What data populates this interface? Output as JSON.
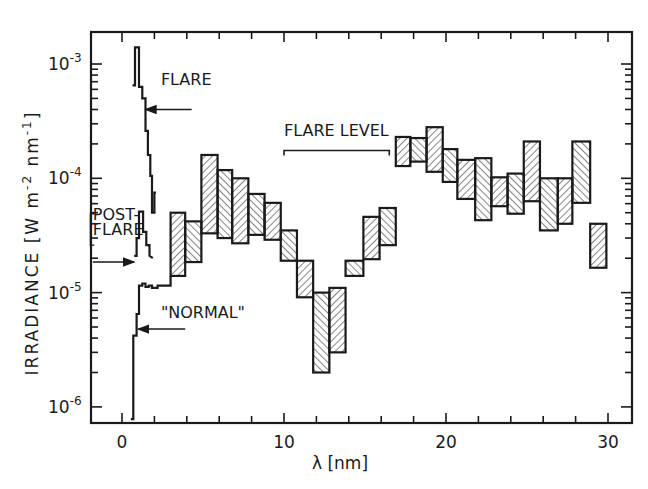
{
  "chart_data": {
    "type": "bar",
    "subtype": "floating-range-histogram-with-step-lines",
    "title": "",
    "xlabel": "λ [nm]",
    "ylabel": "IRRADIANCE [W m^-2 nm^-1]",
    "ylabel_parts": {
      "main": "IRRADIANCE [W m",
      "exp1": "-2",
      "mid": " nm",
      "exp2": "-1",
      "end": "]"
    },
    "yscale": "log",
    "xlim": [
      -2.1,
      31.5
    ],
    "ylim": [
      7e-07,
      0.002
    ],
    "grid": false,
    "x_ticks": [
      0,
      10,
      20,
      30
    ],
    "x_minor_step": 2,
    "y_ticks": [
      {
        "value": 0.001,
        "base": "10",
        "exp": "-3"
      },
      {
        "value": 0.0001,
        "base": "10",
        "exp": "-4"
      },
      {
        "value": 1e-05,
        "base": "10",
        "exp": "-5"
      },
      {
        "value": 1e-06,
        "base": "10",
        "exp": "-6"
      }
    ],
    "bars": {
      "name": "Irradiance range (hatched)",
      "bin_edges": [
        3.0,
        3.9,
        4.9,
        5.9,
        6.8,
        7.8,
        8.8,
        9.8,
        10.8,
        11.8,
        12.8,
        13.8,
        14.9,
        15.9,
        16.9,
        17.8,
        18.8,
        19.8,
        20.7,
        21.8,
        22.8,
        23.8,
        24.8,
        25.8,
        26.9,
        27.8,
        28.9,
        29.9
      ],
      "high": [
        5e-05,
        4.2e-05,
        0.00016,
        0.000118,
        0.0001,
        7.3e-05,
        6.1e-05,
        3.5e-05,
        1.9e-05,
        1e-05,
        1.1e-05,
        1.9e-05,
        4.6e-05,
        5.5e-05,
        0.00023,
        0.000225,
        0.00028,
        0.00018,
        0.000145,
        0.00015,
        0.000102,
        0.00011,
        0.00021,
        0.0001,
        0.0001,
        0.00021,
        4e-05
      ],
      "low": [
        1.4e-05,
        1.85e-05,
        3.3e-05,
        3e-05,
        2.7e-05,
        3.2e-05,
        2.9e-05,
        1.9e-05,
        9.1e-06,
        2e-06,
        3e-06,
        1.4e-05,
        1.96e-05,
        2.6e-05,
        0.000128,
        0.00014,
        0.000114,
        9.3e-05,
        6.6e-05,
        4.3e-05,
        5.7e-05,
        4.9e-05,
        6.3e-05,
        3.5e-05,
        4e-05,
        6.1e-05,
        1.65e-05
      ]
    },
    "series": [
      {
        "name": "FLARE",
        "points": [
          [
            0.65,
            0.00065
          ],
          [
            0.8,
            0.00065
          ],
          [
            0.8,
            0.0014
          ],
          [
            1.05,
            0.0014
          ],
          [
            1.05,
            0.00063
          ],
          [
            1.25,
            0.00063
          ],
          [
            1.25,
            0.0005
          ],
          [
            1.45,
            0.0005
          ],
          [
            1.45,
            0.00026
          ],
          [
            1.6,
            0.00026
          ],
          [
            1.6,
            0.00016
          ],
          [
            1.75,
            0.00016
          ],
          [
            1.75,
            0.000105
          ],
          [
            1.85,
            0.000105
          ],
          [
            1.85,
            5e-05
          ],
          [
            2.0,
            5e-05
          ],
          [
            2.0,
            7.5e-05
          ],
          [
            2.1,
            7.5e-05
          ]
        ]
      },
      {
        "name": "POST-FLARE",
        "points": [
          [
            0.75,
            2.1e-05
          ],
          [
            0.9,
            2.1e-05
          ],
          [
            0.9,
            3e-05
          ],
          [
            1.05,
            3e-05
          ],
          [
            1.05,
            5.1e-05
          ],
          [
            1.3,
            5.1e-05
          ],
          [
            1.3,
            3.4e-05
          ],
          [
            1.5,
            3.4e-05
          ],
          [
            1.5,
            2.6e-05
          ],
          [
            1.7,
            2.6e-05
          ],
          [
            1.7,
            2.1e-05
          ],
          [
            1.9,
            2e-05
          ]
        ]
      },
      {
        "name": "\"NORMAL\"",
        "points": [
          [
            0.55,
            7.8e-07
          ],
          [
            0.7,
            7.8e-07
          ],
          [
            0.7,
            4.2e-06
          ],
          [
            0.9,
            4.2e-06
          ],
          [
            0.9,
            6.5e-06
          ],
          [
            1.05,
            6.5e-06
          ],
          [
            1.05,
            1.15e-05
          ],
          [
            1.25,
            1.15e-05
          ],
          [
            1.25,
            1.2e-05
          ],
          [
            1.45,
            1.2e-05
          ],
          [
            1.45,
            1.12e-05
          ],
          [
            1.65,
            1.12e-05
          ],
          [
            1.65,
            1.15e-05
          ],
          [
            1.85,
            1.15e-05
          ],
          [
            1.85,
            1.1e-05
          ],
          [
            2.2,
            1.1e-05
          ],
          [
            2.2,
            1.15e-05
          ],
          [
            3.0,
            1.15e-05
          ],
          [
            3.0,
            1.4e-05
          ]
        ]
      }
    ],
    "annotations": [
      {
        "text": "FLARE",
        "x": 2.4,
        "y": 0.00065,
        "arrow_to": [
          1.45,
          0.0004
        ],
        "arrow_from": [
          4.3,
          0.0004
        ]
      },
      {
        "text": "FLARE LEVEL",
        "x": 10.0,
        "y": 0.000235,
        "bracket": [
          10.0,
          16.5
        ],
        "bracket_y": 0.000175
      },
      {
        "text": "POST-",
        "x": -1.8,
        "y": 4.3e-05
      },
      {
        "text": "FLARE",
        "x": -1.8,
        "y": 3.2e-05
      },
      {
        "text": "\"NORMAL\"",
        "x": 2.4,
        "y": 6e-06,
        "arrow_to": [
          1.0,
          4.8e-06
        ],
        "arrow_from": [
          3.9,
          4.8e-06
        ]
      }
    ],
    "post_flare_arrow": {
      "from": [
        -1.8,
        1.85e-05
      ],
      "to": [
        0.75,
        1.85e-05
      ]
    }
  }
}
